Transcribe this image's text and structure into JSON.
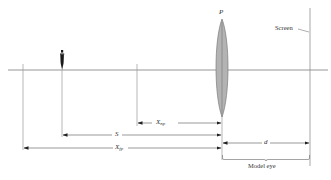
{
  "diagram": {
    "type": "optics-model-eye",
    "colors": {
      "line": "#8a8a8a",
      "arrow": "#333333",
      "lens_fill": "#b3b3b3",
      "lens_stroke": "#7a7a7a",
      "object": "#1a1a1a",
      "screen": "#c8c8c8",
      "text": "#333333"
    },
    "labels": {
      "lens": "P",
      "screen": "Screen",
      "x_np_main": "X",
      "x_np_sub": "np",
      "s": "S",
      "x_fp_main": "X",
      "x_fp_sub": "fp",
      "d": "d",
      "model_eye": "Model eye"
    },
    "elements": [
      {
        "name": "optical-axis",
        "kind": "line"
      },
      {
        "name": "far-point-marker",
        "kind": "vertical-line"
      },
      {
        "name": "object",
        "kind": "figure"
      },
      {
        "name": "near-point-marker",
        "kind": "vertical-line"
      },
      {
        "name": "lens",
        "kind": "converging-lens",
        "label": "P"
      },
      {
        "name": "screen",
        "kind": "vertical-line",
        "label": "Screen"
      }
    ],
    "dimensions": [
      {
        "label": "X_np",
        "from": "near-point-marker",
        "to": "lens"
      },
      {
        "label": "S",
        "from": "object",
        "to": "lens"
      },
      {
        "label": "X_fp",
        "from": "far-point-marker",
        "to": "lens"
      },
      {
        "label": "d",
        "from": "lens",
        "to": "screen"
      },
      {
        "label": "Model eye",
        "from": "lens",
        "to": "screen",
        "kind": "brace"
      }
    ]
  }
}
